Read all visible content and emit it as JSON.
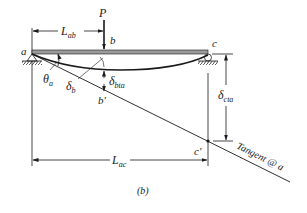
{
  "figure": {
    "caption": "(b)",
    "labels": {
      "load": "P",
      "point_a": "a",
      "point_b": "b",
      "point_c": "c",
      "point_b_prime": "b′",
      "point_c_prime": "c′",
      "theta": "θ",
      "theta_sub": "a",
      "delta_b": "δ",
      "delta_b_sub": "b",
      "delta_bta": "δ",
      "delta_bta_sub": "bta",
      "delta_cta": "δ",
      "delta_cta_sub": "cta",
      "L_ab": "L",
      "L_ab_sub": "ab",
      "L_ac": "L",
      "L_ac_sub": "ac",
      "tangent": "Tangent @ a"
    },
    "colors": {
      "ink": "#1a1a1a",
      "beam_fill": "#9a9a9a",
      "background": "#ffffff"
    }
  }
}
